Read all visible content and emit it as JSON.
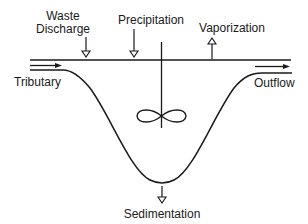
{
  "diagram": {
    "type": "lake mass-balance schematic",
    "labels": {
      "waste_discharge_line1": "Waste",
      "waste_discharge_line2": "Discharge",
      "precipitation": "Precipitation",
      "vaporization": "Vaporization",
      "tributary": "Tributary",
      "outflow": "Outflow",
      "sedimentation": "Sedimentation"
    },
    "elements": {
      "basin": "lake basin cross-section (U-shaped curve)",
      "surface": "water surface line",
      "mixer": "stirrer / complete-mix impeller",
      "inputs": [
        "Tributary",
        "Waste Discharge",
        "Precipitation"
      ],
      "outputs": [
        "Outflow",
        "Vaporization",
        "Sedimentation"
      ]
    },
    "colors": {
      "stroke": "#1a1a1a",
      "background": "#ffffff"
    }
  }
}
